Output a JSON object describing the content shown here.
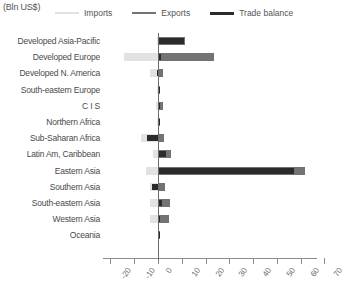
{
  "units_label": "(Bln US$)",
  "legend": [
    {
      "label": "Imports",
      "color": "#e2e2e2"
    },
    {
      "label": "Exports",
      "color": "#737373"
    },
    {
      "label": "Trade balance",
      "color": "#2b2b2b"
    }
  ],
  "axis": {
    "ticks": [
      -20,
      -10,
      0,
      10,
      20,
      30,
      40,
      50,
      60,
      70
    ],
    "tick_labels": [
      "-20",
      "-10",
      "0",
      "10",
      "20",
      "30",
      "40",
      "50",
      "60",
      "70"
    ],
    "min": -20,
    "max": 70
  },
  "chart_data": {
    "type": "bar",
    "orientation": "horizontal",
    "title": "",
    "subtitle": "",
    "xlabel": "(Bln US$)",
    "ylabel": "",
    "xlim": [
      -20,
      70
    ],
    "grid": false,
    "legend_position": "top",
    "categories": [
      "Developed Asia-Pacific",
      "Developed Europe",
      "Developed N. America",
      "South-eastern Europe",
      "C I S",
      "Northern Africa",
      "Sub-Saharan Africa",
      "Latin Am, Caribbean",
      "Eastern Asia",
      "Southern Asia",
      "South-eastern Asia",
      "Western Asia",
      "Oceania"
    ],
    "series": [
      {
        "name": "Imports",
        "color": "#e2e2e2",
        "values": [
          -0.4,
          -14.5,
          -3.5,
          -0.3,
          -1.0,
          -0.3,
          -7.2,
          -2.0,
          -5.0,
          -3.5,
          -3.5,
          -3.5,
          -0.2
        ]
      },
      {
        "name": "Exports",
        "color": "#737373",
        "values": [
          11.5,
          23.5,
          2.0,
          0.6,
          2.2,
          0.4,
          2.5,
          5.5,
          62.0,
          3.0,
          5.0,
          4.5,
          0.2
        ]
      },
      {
        "name": "Trade balance",
        "color": "#2b2b2b",
        "values": [
          11.0,
          1.2,
          -0.5,
          0.3,
          1.0,
          0.1,
          -4.5,
          3.5,
          57.0,
          -2.5,
          1.5,
          1.0,
          0.1
        ]
      }
    ]
  }
}
